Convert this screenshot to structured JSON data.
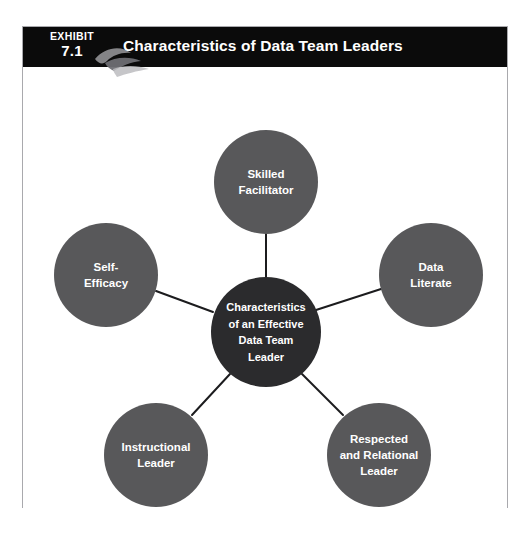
{
  "exhibit": {
    "label_word": "EXHIBIT",
    "number": "7.1",
    "title": "Characteristics of Data Team Leaders",
    "swoosh_icon": "leaf-swoosh-icon"
  },
  "colors": {
    "header_background": "#0b0b0b",
    "header_text": "#ffffff",
    "center_node": "#2b2b2d",
    "outer_node": "#58585a",
    "node_text": "#ffffff",
    "connector": "#1c1c1e",
    "frame_border": "#a9a9ad",
    "page_background": "#ffffff"
  },
  "diagram": {
    "type": "radial-hub-and-spoke",
    "center": {
      "id": "center-node",
      "label": "Characteristics\nof an Effective\nData Team\nLeader",
      "cx": 243,
      "cy": 265,
      "r": 55
    },
    "nodes": [
      {
        "id": "skilled-facilitator",
        "label": "Skilled\nFacilitator",
        "cx": 243,
        "cy": 115,
        "r": 52
      },
      {
        "id": "data-literate",
        "label": "Data\nLiterate",
        "cx": 408,
        "cy": 208,
        "r": 52
      },
      {
        "id": "respected-and-relational-leader",
        "label": "Respected\nand Relational\nLeader",
        "cx": 356,
        "cy": 388,
        "r": 52
      },
      {
        "id": "instructional-leader",
        "label": "Instructional\nLeader",
        "cx": 133,
        "cy": 388,
        "r": 52
      },
      {
        "id": "self-efficacy",
        "label": "Self-\nEfficacy",
        "cx": 83,
        "cy": 208,
        "r": 52
      }
    ],
    "connectors": [
      {
        "from": "center-node",
        "to": "skilled-facilitator"
      },
      {
        "from": "center-node",
        "to": "data-literate"
      },
      {
        "from": "center-node",
        "to": "respected-and-relational-leader"
      },
      {
        "from": "center-node",
        "to": "instructional-leader"
      },
      {
        "from": "center-node",
        "to": "self-efficacy"
      }
    ]
  }
}
